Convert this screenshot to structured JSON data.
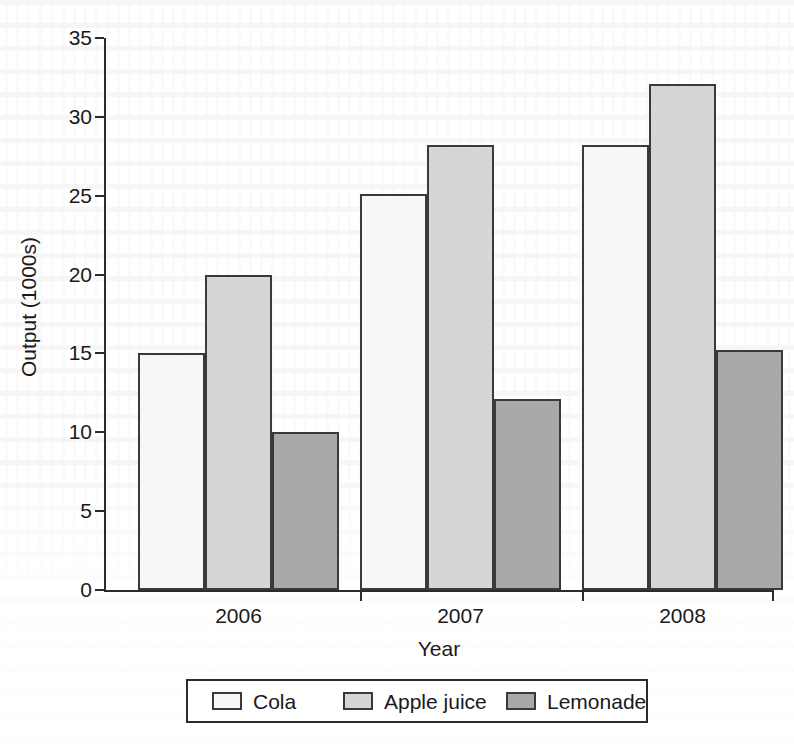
{
  "chart_data": {
    "type": "bar",
    "title": "",
    "xlabel": "Year",
    "ylabel": "Output (1000s)",
    "categories": [
      "2006",
      "2007",
      "2008"
    ],
    "series": [
      {
        "name": "Cola",
        "values": [
          15.0,
          25.1,
          28.2
        ],
        "color": "#f7f7f7"
      },
      {
        "name": "Apple juice",
        "values": [
          20.0,
          28.2,
          32.1
        ],
        "color": "#d6d6d6"
      },
      {
        "name": "Lemonade",
        "values": [
          10.0,
          12.1,
          15.2
        ],
        "color": "#a9a9a9"
      }
    ],
    "ylim": [
      0,
      35
    ],
    "yticks": [
      "0",
      "5",
      "10",
      "15",
      "20",
      "25",
      "30",
      "35"
    ],
    "ytick_values": [
      0,
      5,
      10,
      15,
      20,
      25,
      30,
      35
    ],
    "grid": false,
    "legend_position": "bottom",
    "bar_edge_color": "#3a3a3a",
    "axis_color": "#2b2b2b"
  },
  "legend": {
    "entries": [
      {
        "label": "Cola"
      },
      {
        "label": "Apple juice"
      },
      {
        "label": "Lemonade"
      }
    ]
  }
}
